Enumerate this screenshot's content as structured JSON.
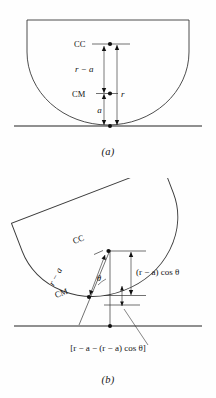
{
  "figure": {
    "type": "physics-diagram",
    "background_color": "#fefefe",
    "line_color": "#3a3a3a",
    "text_color": "#141414"
  },
  "panels": [
    {
      "id": "a",
      "caption": "(a)",
      "description": "Semicircular bowl at rest on a horizontal surface",
      "labels": {
        "cc": "CC",
        "cm": "CM",
        "r_minus_a": "r − a",
        "r": "r",
        "a": "a"
      },
      "points": {
        "cc_label": "CC",
        "cm_label": "CM"
      },
      "dimensions": [
        {
          "name": "r-minus-a",
          "text": "r − a",
          "from": "CM",
          "to": "CC"
        },
        {
          "name": "a",
          "text": "a",
          "from": "contact-point",
          "to": "CM"
        },
        {
          "name": "r",
          "text": "r",
          "from": "contact-point",
          "to": "CC"
        }
      ]
    },
    {
      "id": "b",
      "caption": "(b)",
      "description": "Same bowl tilted through angle theta",
      "labels": {
        "cc": "CC",
        "cm": "CM",
        "r_minus_a": "r − a",
        "theta": "θ",
        "r_minus_a_cos_theta": "(r − a) cos θ",
        "bracket_expression": "[r − a − (r − a) cos θ]"
      },
      "dimensions": [
        {
          "name": "r-minus-a",
          "text": "r − a",
          "from": "CM",
          "to": "CC"
        },
        {
          "name": "r-minus-a-cos-theta",
          "text": "(r − a) cos θ",
          "from": "CM-level",
          "to": "CC"
        },
        {
          "name": "height-difference",
          "text": "[r − a − (r − a) cos θ]",
          "from": "CM-level",
          "to": "CM"
        }
      ],
      "angle": {
        "name": "theta",
        "text": "θ"
      }
    }
  ]
}
